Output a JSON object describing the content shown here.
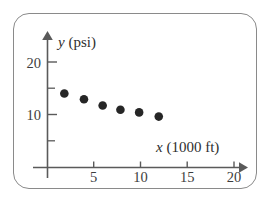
{
  "figure": {
    "frame_color": "#8a8a8a",
    "axis_color": "#5a5a5a",
    "point_color": "#262626",
    "background": "#ffffff"
  },
  "axes": {
    "x_axis_title_var": "x",
    "x_axis_title_unit": " (1000 ft)",
    "y_axis_title_var": "y",
    "y_axis_title_unit": " (psi)",
    "x_tick_labels": [
      "5",
      "10",
      "15",
      "20"
    ],
    "y_tick_labels": [
      "10",
      "20"
    ]
  },
  "chart_data": {
    "type": "scatter",
    "title": "",
    "xlabel": "x (1000 ft)",
    "ylabel": "y (psi)",
    "xlim": [
      0,
      22
    ],
    "ylim": [
      0,
      22
    ],
    "xticks": [
      5,
      10,
      15,
      20
    ],
    "yticks": [
      10,
      20
    ],
    "minor_yticks": [
      5,
      15
    ],
    "grid": false,
    "legend": null,
    "series": [
      {
        "name": "pressure vs altitude",
        "x": [
          1.8,
          3.9,
          5.9,
          7.8,
          9.8,
          11.9
        ],
        "y": [
          14.1,
          13.0,
          11.8,
          11.0,
          10.5,
          9.7
        ]
      }
    ]
  }
}
